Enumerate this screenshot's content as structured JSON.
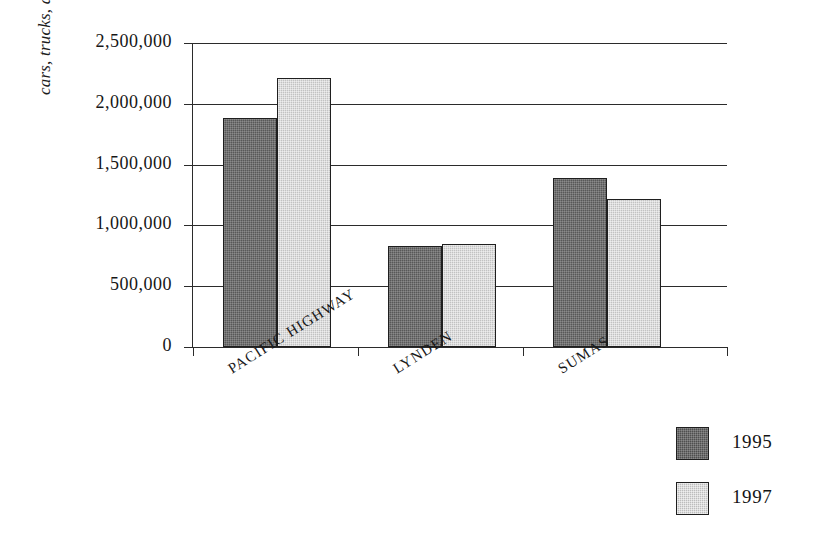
{
  "chart_data": {
    "type": "bar",
    "title": "",
    "subtitle": "",
    "xlabel": "",
    "ylabel": "cars, trucks, and buses",
    "categories": [
      "PACIFIC HIGHWAY",
      "LYNDEN",
      "SUMAS"
    ],
    "series": [
      {
        "name": "1995",
        "color": "#585858",
        "values": [
          1880000,
          830000,
          1390000
        ]
      },
      {
        "name": "1997",
        "color": "#c2c2c2",
        "values": [
          2210000,
          850000,
          1220000
        ]
      }
    ],
    "ylim": [
      0,
      2500000
    ],
    "ytick_values": [
      0,
      500000,
      1000000,
      1500000,
      2000000,
      2500000
    ],
    "ytick_labels": [
      "0",
      "500,000",
      "1,000,000",
      "1,500,000",
      "2,000,000",
      "2,500,000"
    ],
    "grid": true,
    "grid_axis": "y",
    "legend_position": "bottom-right",
    "annotations": []
  },
  "axis": {
    "y_title": "cars, trucks, and buses"
  },
  "legend": {
    "entries": [
      {
        "label": "1995",
        "color": "#585858"
      },
      {
        "label": "1997",
        "color": "#c2c2c2"
      }
    ]
  }
}
